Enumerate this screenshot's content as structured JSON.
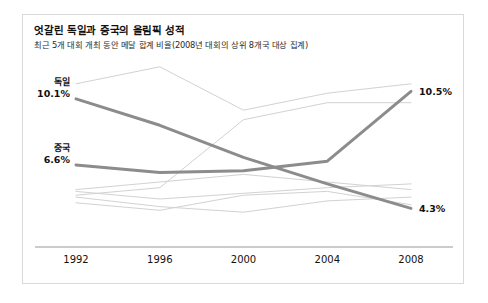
{
  "card": {
    "title": "엇갈린 독일과 중국의 올림픽 성적",
    "subtitle": "최근 5개 대회 개최 동안 메달 합계 비율(2008년 대회의 상위 8개국 대상 집계)"
  },
  "chart_data": {
    "type": "line",
    "title": "엇갈린 독일과 중국의 올림픽 성적",
    "subtitle": "최근 5개 대회 개최 동안 메달 합계 비율(2008년 대회의 상위 8개국 대상 집계)",
    "xlabel": "",
    "ylabel": "",
    "categories": [
      "1992",
      "1996",
      "2000",
      "2004",
      "2008"
    ],
    "tick_labels": [
      "1992",
      "1996",
      "2000",
      "2004",
      "2008"
    ],
    "ylim": [
      3.0,
      12.0
    ],
    "grid": false,
    "legend": "inline-labels",
    "value_suffix": "%",
    "highlight_color": "#8c8c8c",
    "muted_color": "#d2d2d2",
    "axis_color": "#9a9a9a",
    "series": [
      {
        "name": "독일",
        "highlight": true,
        "start_label": "독일",
        "start_value_label": "10.1%",
        "end_value_label": "4.3%",
        "values": [
          10.1,
          8.7,
          7.0,
          5.6,
          4.3
        ]
      },
      {
        "name": "중국",
        "highlight": true,
        "start_label": "중국",
        "start_value_label": "6.6%",
        "end_value_label": "10.5%",
        "values": [
          6.6,
          6.2,
          6.3,
          6.8,
          10.5
        ]
      },
      {
        "name": "기타국 1",
        "highlight": false,
        "values": [
          10.9,
          11.8,
          9.5,
          10.4,
          10.9
        ]
      },
      {
        "name": "기타국 2",
        "highlight": false,
        "values": [
          5.0,
          5.4,
          9.0,
          9.9,
          9.9
        ]
      },
      {
        "name": "기타국 3",
        "highlight": false,
        "values": [
          5.3,
          5.7,
          6.1,
          5.7,
          5.3
        ]
      },
      {
        "name": "기타국 4",
        "highlight": false,
        "values": [
          5.2,
          4.8,
          5.1,
          5.4,
          5.6
        ]
      },
      {
        "name": "기타국 5",
        "highlight": false,
        "values": [
          4.6,
          4.2,
          5.0,
          5.2,
          4.5
        ]
      },
      {
        "name": "기타국 6",
        "highlight": false,
        "values": [
          4.9,
          4.4,
          4.1,
          4.7,
          4.9
        ]
      }
    ]
  },
  "annotations": {
    "germany_start_name": "독일",
    "germany_start_value": "10.1%",
    "china_start_name": "중국",
    "china_start_value": "6.6%",
    "china_end_value": "10.5%",
    "germany_end_value": "4.3%"
  }
}
